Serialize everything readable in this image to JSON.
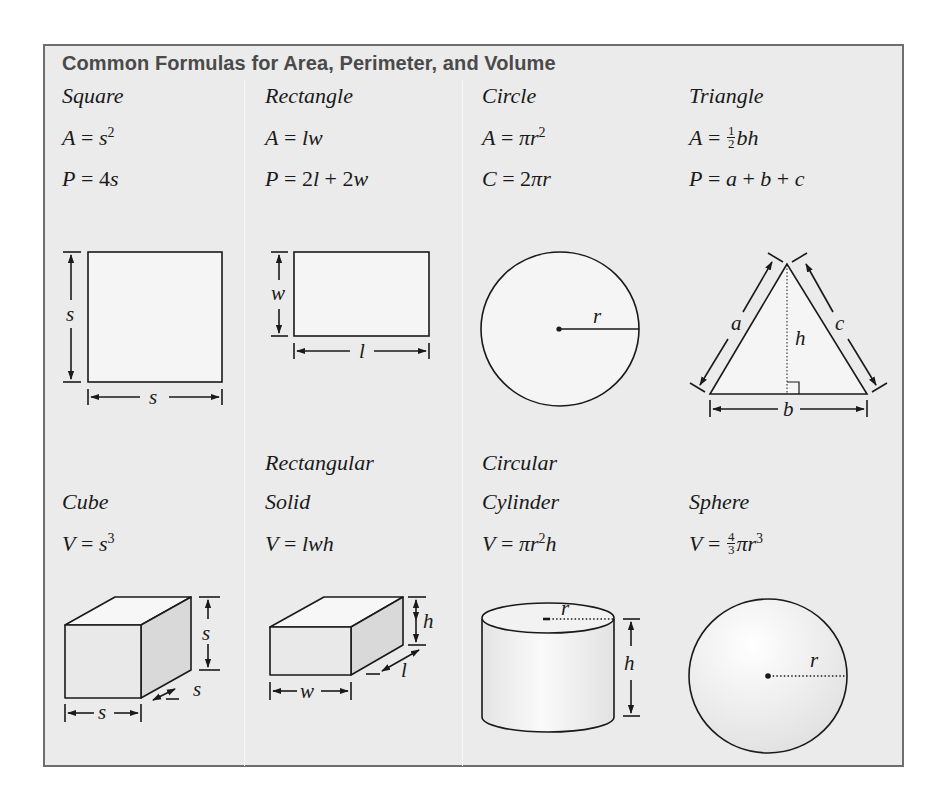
{
  "title": "Common Formulas for Area, Perimeter, and Volume",
  "colors": {
    "panel_background": "#ebebeb",
    "panel_border": "#6e6e6e",
    "title_color": "#4a4a4a",
    "ink": "#1a1a1a"
  },
  "row1": [
    {
      "name": "Square",
      "formulas": [
        {
          "lhs": "A",
          "rhs_vars": "s",
          "sup": "2"
        },
        {
          "lhs": "P",
          "rhs_num": "4",
          "rhs_vars": "s"
        }
      ],
      "labels": {
        "side_vertical": "s",
        "side_horizontal": "s"
      }
    },
    {
      "name": "Rectangle",
      "formulas": [
        {
          "lhs": "A",
          "rhs": "lw"
        },
        {
          "lhs": "P",
          "rhs_parts": [
            "2",
            "l",
            " + ",
            "2",
            "w"
          ]
        }
      ],
      "labels": {
        "width": "w",
        "length": "l"
      }
    },
    {
      "name": "Circle",
      "formulas": [
        {
          "lhs": "A",
          "rhs": "πr",
          "sup": "2"
        },
        {
          "lhs": "C",
          "rhs_num": "2",
          "rhs": "πr"
        }
      ],
      "labels": {
        "radius": "r"
      }
    },
    {
      "name": "Triangle",
      "formulas": [
        {
          "lhs": "A",
          "frac_num": "1",
          "frac_den": "2",
          "rhs": "bh"
        },
        {
          "lhs": "P",
          "rhs_parts": [
            "a",
            " + ",
            "b",
            " + ",
            "c"
          ]
        }
      ],
      "labels": {
        "side_a": "a",
        "side_c": "c",
        "height": "h",
        "base": "b"
      }
    }
  ],
  "row2": [
    {
      "name_line1": "",
      "name_line2": "Cube",
      "formula": {
        "lhs": "V",
        "rhs": "s",
        "sup": "3"
      },
      "labels": {
        "height": "s",
        "depth": "s",
        "width": "s"
      }
    },
    {
      "name_line1": "Rectangular",
      "name_line2": "Solid",
      "formula": {
        "lhs": "V",
        "rhs": "lwh"
      },
      "labels": {
        "height": "h",
        "length": "l",
        "width": "w"
      }
    },
    {
      "name_line1": "Circular",
      "name_line2": "Cylinder",
      "formula": {
        "lhs": "V",
        "rhs": "πr",
        "sup": "2",
        "rhs_tail": "h"
      },
      "labels": {
        "radius": "r",
        "height": "h"
      }
    },
    {
      "name_line1": "",
      "name_line2": "Sphere",
      "formula": {
        "lhs": "V",
        "frac_num": "4",
        "frac_den": "3",
        "rhs": "πr",
        "sup": "3"
      },
      "labels": {
        "radius": "r"
      }
    }
  ],
  "equals": "="
}
